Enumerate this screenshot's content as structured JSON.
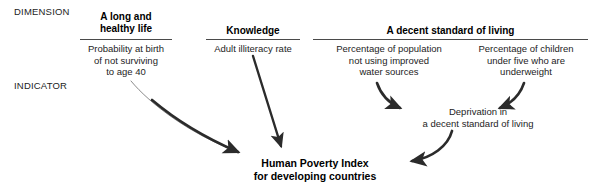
{
  "figure": {
    "row_labels": {
      "dimension": "DIMENSION",
      "indicator": "INDICATOR"
    },
    "dimensions": [
      {
        "id": "health",
        "label": "A long and\nhealthy life"
      },
      {
        "id": "knowledge",
        "label": "Knowledge"
      },
      {
        "id": "living",
        "label": "A decent standard of living"
      }
    ],
    "indicators": [
      {
        "id": "survival",
        "label": "Probability at birth\nof not surviving\nto age 40"
      },
      {
        "id": "literacy",
        "label": "Adult illiteracy rate"
      },
      {
        "id": "water",
        "label": "Percentage of population\nnot using improved\nwater sources"
      },
      {
        "id": "underweight",
        "label": "Percentage of children\nunder five who are\nunderweight"
      }
    ],
    "intermediate_node": {
      "id": "deprivation",
      "label": "Deprivation in\na decent standard of living"
    },
    "result_node": {
      "id": "hpi",
      "label": "Human Poverty Index\nfor developing countries"
    },
    "flows": [
      {
        "from": "survival",
        "to": "hpi"
      },
      {
        "from": "literacy",
        "to": "hpi"
      },
      {
        "from": "water",
        "to": "deprivation"
      },
      {
        "from": "underweight",
        "to": "deprivation"
      },
      {
        "from": "deprivation",
        "to": "hpi"
      }
    ],
    "colors": {
      "text": "#1d1d1d",
      "heading": "#000000",
      "rule": "#4a4a4a",
      "arrow": "#2b2b2b",
      "background": "#ffffff"
    }
  }
}
